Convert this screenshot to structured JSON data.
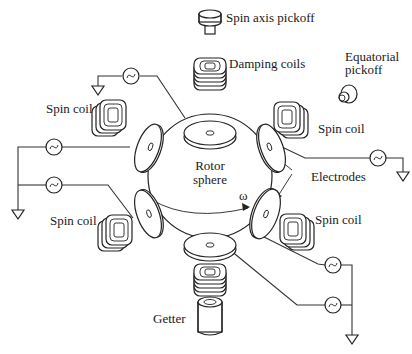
{
  "diagram": {
    "labels": {
      "spin_axis_pickoff": "Spin axis pickoff",
      "damping_coils": "Damping coils",
      "equatorial_pickoff_line1": "Equatorial",
      "equatorial_pickoff_line2": "pickoff",
      "spin_coil_upper_left": "Spin coil",
      "spin_coil_upper_right": "Spin coil",
      "spin_coil_lower_left": "Spin coil",
      "spin_coil_lower_right": "Spin coil",
      "rotor_line1": "Rotor",
      "rotor_line2": "sphere",
      "omega": "ω",
      "electrodes": "Electrodes",
      "getter": "Getter"
    },
    "components": [
      {
        "id": "rotor-sphere",
        "type": "sphere"
      },
      {
        "id": "electrode-top",
        "type": "disc-electrode"
      },
      {
        "id": "electrode-bottom",
        "type": "disc-electrode"
      },
      {
        "id": "electrode-upper-left",
        "type": "disc-electrode"
      },
      {
        "id": "electrode-lower-left",
        "type": "disc-electrode"
      },
      {
        "id": "electrode-upper-right",
        "type": "disc-electrode"
      },
      {
        "id": "electrode-lower-right",
        "type": "disc-electrode"
      },
      {
        "id": "ac-source",
        "type": "ac-source-icon",
        "count": 6
      },
      {
        "id": "ground",
        "type": "ground-icon",
        "count": 3
      }
    ],
    "colors": {
      "line": "#222222",
      "background": "#ffffff"
    }
  }
}
